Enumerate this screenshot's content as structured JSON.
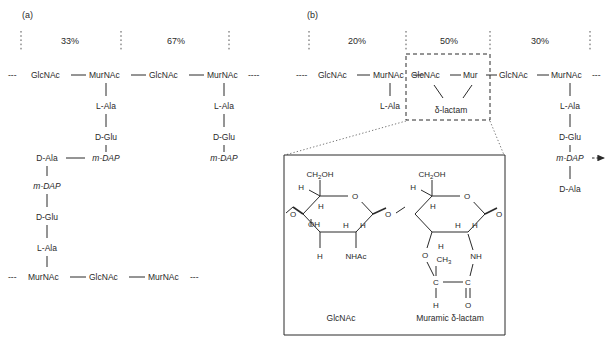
{
  "figure": {
    "type": "diagram",
    "panels": [
      {
        "id": "a",
        "label": "(a)",
        "percentages": [
          "33%",
          "67%"
        ],
        "top_backbone": {
          "left_dashes": "---",
          "units": [
            "GlcNAc",
            "MurNAc",
            "GlcNAc",
            "MurNAc"
          ],
          "right_dashes": "----"
        },
        "bottom_backbone": {
          "left_dashes": "---",
          "units": [
            "MurNAc",
            "GlcNAc",
            "MurNAc"
          ],
          "right_dashes": "---"
        },
        "stem_left": [
          "L-Ala",
          "D-Glu",
          "m-DAP"
        ],
        "stem_right": [
          "L-Ala",
          "D-Glu",
          "m-DAP"
        ],
        "crosslink_left": "D-Ala",
        "crosslink_partner": "m-DAP",
        "lower_stem": [
          "m-DAP",
          "D-Glu",
          "L-Ala"
        ]
      },
      {
        "id": "b",
        "label": "(b)",
        "percentages": [
          "20%",
          "50%",
          "30%"
        ],
        "backbone": {
          "left_dashes": "----",
          "units": [
            "GlcNAc",
            "MurNAc",
            "GlcNAc",
            "Mur",
            "GlcNAc",
            "MurNAc"
          ],
          "right_dashes": "---"
        },
        "stem_first": [
          "L-Ala"
        ],
        "lactam_label": "δ-lactam",
        "stem_last": [
          "L-Ala",
          "D-Glu",
          "m-DAP",
          "D-Ala"
        ],
        "arrow_label": ""
      }
    ],
    "inset": {
      "caption_left": "GlcNAc",
      "caption_right": "Muramic δ-lactam",
      "left_ring": {
        "top_substituent": "CH₂OH",
        "ring_O": "O",
        "glyco_O_left": "O",
        "glyco_O_right": "O",
        "hydrogens": [
          "H",
          "H",
          "H",
          "H",
          "H"
        ],
        "hydroxyl": "OH",
        "acetamido": "NHAc"
      },
      "right_ring": {
        "top_substituent": "CH₂OH",
        "ring_O": "O",
        "glyco_O_right": "O",
        "lactam_O": "O",
        "methyl": "CH₃",
        "carbon_left": "C",
        "carbon_right": "C",
        "carbonyl_O": "O",
        "amide_N": "NH",
        "hydrogens": [
          "H",
          "H",
          "H",
          "H",
          "H",
          "H"
        ]
      }
    },
    "colors": {
      "ink": "#2a2a2a",
      "line": "#3a3a3a",
      "background": "#ffffff"
    }
  }
}
